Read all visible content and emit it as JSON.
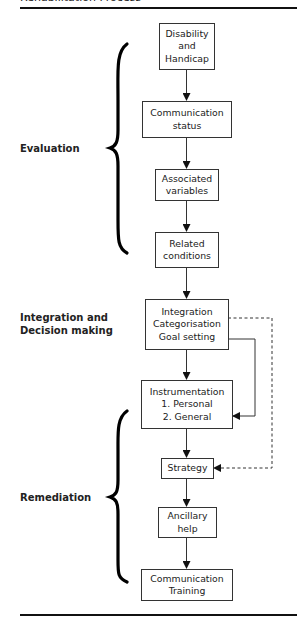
{
  "header": {
    "title": "Rehabilitation Process"
  },
  "stages": [
    {
      "id": "evaluation",
      "label": "Evaluation"
    },
    {
      "id": "integration",
      "label": "Integration and\nDecision making"
    },
    {
      "id": "remediation",
      "label": "Remediation"
    }
  ],
  "boxes": [
    {
      "id": "disability",
      "label": "Disability\nand\nHandicap"
    },
    {
      "id": "communication-status",
      "label": "Communication\nstatus"
    },
    {
      "id": "associated-variables",
      "label": "Associated\nvariables"
    },
    {
      "id": "related-conditions",
      "label": "Related\nconditions"
    },
    {
      "id": "integration-box",
      "label": "Integration\nCategorisation\nGoal setting"
    },
    {
      "id": "instrumentation",
      "label": "Instrumentation\n1. Personal\n2. General"
    },
    {
      "id": "strategy",
      "label": "Strategy"
    },
    {
      "id": "ancillary-help",
      "label": "Ancillary\nhelp"
    },
    {
      "id": "communication-training",
      "label": "Communication\nTraining"
    }
  ],
  "connectors": [
    {
      "from": "disability",
      "to": "communication-status",
      "style": "solid"
    },
    {
      "from": "communication-status",
      "to": "associated-variables",
      "style": "solid"
    },
    {
      "from": "associated-variables",
      "to": "related-conditions",
      "style": "solid"
    },
    {
      "from": "related-conditions",
      "to": "integration-box",
      "style": "solid"
    },
    {
      "from": "integration-box",
      "to": "instrumentation",
      "style": "solid"
    },
    {
      "from": "integration-box",
      "to": "instrumentation",
      "style": "solid",
      "route": "right-side"
    },
    {
      "from": "integration-box",
      "to": "strategy",
      "style": "dashed",
      "route": "right-side"
    },
    {
      "from": "instrumentation",
      "to": "strategy",
      "style": "solid"
    },
    {
      "from": "strategy",
      "to": "ancillary-help",
      "style": "solid"
    },
    {
      "from": "ancillary-help",
      "to": "communication-training",
      "style": "solid"
    }
  ],
  "colors": {
    "line": "#333333",
    "text": "#222222",
    "background": "#ffffff"
  }
}
